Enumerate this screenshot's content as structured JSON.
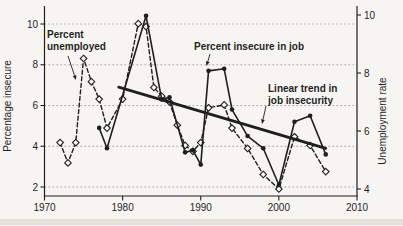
{
  "figure": {
    "background": "#f7f5f2",
    "ink": "#1f1f1f",
    "grid_color": "#9b9b9b",
    "marker_fill": "#fbfaf7",
    "smudge_color": "#c9c5be"
  },
  "chart_data": {
    "type": "line",
    "title": "",
    "x_axis": {
      "range": [
        1970,
        2010
      ],
      "ticks": [
        1970,
        1980,
        1990,
        2000,
        2010
      ],
      "label": ""
    },
    "y_left_axis": {
      "label": "Percentage insecure",
      "ticks": [
        2,
        4,
        6,
        8,
        10
      ],
      "range": [
        2,
        10.6
      ]
    },
    "y_right_axis": {
      "label": "Unemployment rate",
      "ticks": [
        4,
        6,
        8,
        10
      ],
      "range": [
        4,
        10.2
      ]
    },
    "grid": {
      "style": "horizontal-dotted",
      "follows": "left-axis"
    },
    "legend_position": "annotated-inline",
    "series": [
      {
        "name": "Percent unemployed",
        "axis": "right",
        "line": "dashed",
        "marker": "open-diamond",
        "x": [
          1972,
          1973,
          1974,
          1975,
          1976,
          1977,
          1978,
          1980,
          1982,
          1983,
          1984,
          1985,
          1986,
          1987,
          1988,
          1989,
          1990,
          1991,
          1993,
          1994,
          1996,
          1998,
          2000,
          2002,
          2004,
          2006
        ],
        "y": [
          5.6,
          4.9,
          5.6,
          8.5,
          7.7,
          7.1,
          6.1,
          7.1,
          9.7,
          9.6,
          7.5,
          7.2,
          7.0,
          6.2,
          5.5,
          5.3,
          5.6,
          6.8,
          6.9,
          6.1,
          5.4,
          4.5,
          4.0,
          5.8,
          5.5,
          4.6
        ]
      },
      {
        "name": "Percent insecure in job",
        "axis": "left",
        "line": "solid",
        "marker": "filled-circle",
        "x": [
          1977,
          1978,
          1983,
          1985,
          1986,
          1988,
          1989,
          1990,
          1991,
          1993,
          1994,
          1996,
          1998,
          2000,
          2002,
          2004,
          2006
        ],
        "y": [
          4.9,
          3.9,
          10.4,
          6.3,
          6.4,
          3.7,
          3.8,
          3.1,
          7.7,
          7.8,
          5.8,
          4.5,
          3.9,
          2.1,
          5.2,
          5.5,
          3.6
        ]
      },
      {
        "name": "Linear trend in job insecurity",
        "axis": "left",
        "line": "solid-thick",
        "marker": "none",
        "x": [
          1979.5,
          2006
        ],
        "y": [
          6.9,
          3.9
        ]
      }
    ],
    "annotations": [
      {
        "id": "percent-unemployed-label",
        "lines": [
          "Percent",
          "unemployed"
        ],
        "x": 47,
        "y": 38,
        "line_height": 12,
        "arrow": {
          "x1": 68,
          "y1": 56,
          "x2": 76,
          "y2": 80
        }
      },
      {
        "id": "percent-insecure-label",
        "lines": [
          "Percent insecure in job"
        ],
        "x": 194,
        "y": 50,
        "line_height": 12,
        "arrow": {
          "x1": 210,
          "y1": 54,
          "x2": 206.5,
          "y2": 66
        }
      },
      {
        "id": "linear-trend-label",
        "lines": [
          "Linear trend in",
          "job insecurity"
        ],
        "x": 268,
        "y": 92,
        "line_height": 12,
        "arrow": {
          "x1": 266,
          "y1": 106,
          "x2": 262,
          "y2": 124
        }
      }
    ]
  }
}
